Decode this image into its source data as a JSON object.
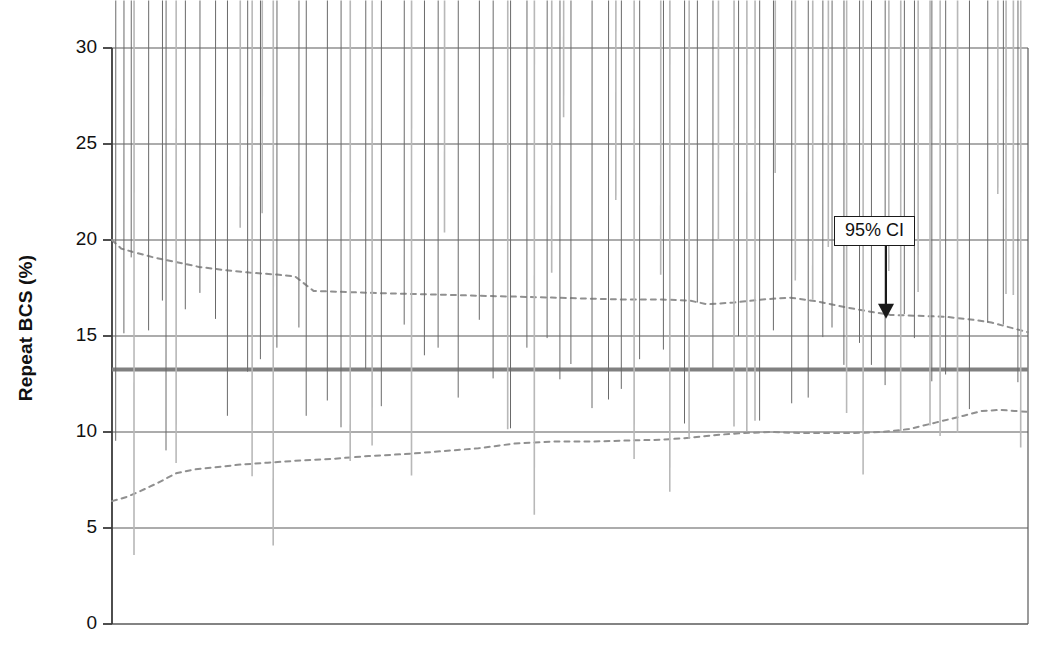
{
  "chart_data": {
    "type": "scatter",
    "title": "",
    "xlabel": "",
    "ylabel": "Repeat BCS (%)",
    "ylim": [
      0,
      30
    ],
    "yticks": [
      0,
      5,
      10,
      15,
      20,
      25,
      30
    ],
    "ytick_labels": [
      "0",
      "5",
      "10",
      "15",
      "20",
      "25",
      "30"
    ],
    "xlim": [
      0,
      100
    ],
    "xticks": [],
    "xtick_labels": [],
    "grid": "horizontal",
    "legend": "none",
    "annotations": [
      {
        "text": "95% CI",
        "x": 84.5,
        "y": 20.4,
        "arrow_to_x": 84.5,
        "arrow_to_y": 16.0,
        "style": "boxed-with-down-arrow"
      }
    ],
    "reference_lines": [
      {
        "name": "mean-line",
        "type": "horizontal-solid",
        "value": 13.25,
        "color": "#808080",
        "width": 4
      }
    ],
    "series": [
      {
        "name": "Repeat BCS - within 95% CI",
        "marker": "filled-diamond",
        "color": "#7a7a7a",
        "points": [
          [
            0.4,
            9.1
          ],
          [
            1.3,
            14.7
          ],
          [
            2.1,
            18.65
          ],
          [
            4.0,
            14.85
          ],
          [
            5.5,
            16.4
          ],
          [
            5.9,
            8.6
          ],
          [
            8.0,
            15.95
          ],
          [
            9.6,
            16.8
          ],
          [
            11.3,
            15.45
          ],
          [
            12.6,
            10.4
          ],
          [
            14.8,
            12.7
          ],
          [
            16.2,
            13.35
          ],
          [
            18.0,
            13.95
          ],
          [
            20.4,
            15.0
          ],
          [
            21.2,
            10.4
          ],
          [
            23.5,
            11.2
          ],
          [
            25.0,
            9.8
          ],
          [
            27.7,
            12.85
          ],
          [
            29.4,
            10.9
          ],
          [
            31.9,
            15.15
          ],
          [
            34.1,
            13.55
          ],
          [
            35.6,
            13.95
          ],
          [
            37.8,
            11.35
          ],
          [
            40.1,
            15.4
          ],
          [
            41.6,
            12.35
          ],
          [
            43.5,
            9.75
          ],
          [
            45.3,
            13.95
          ],
          [
            47.5,
            14.45
          ],
          [
            48.9,
            12.3
          ],
          [
            50.1,
            13.1
          ],
          [
            52.4,
            10.8
          ],
          [
            54.2,
            11.25
          ],
          [
            55.6,
            11.8
          ],
          [
            57.6,
            13.35
          ],
          [
            60.2,
            13.85
          ],
          [
            62.5,
            10.0
          ],
          [
            63.9,
            16.3
          ],
          [
            65.6,
            12.9
          ],
          [
            68.4,
            14.55
          ],
          [
            70.7,
            10.15
          ],
          [
            72.2,
            14.85
          ],
          [
            74.2,
            11.05
          ],
          [
            76.0,
            11.35
          ],
          [
            77.6,
            14.5
          ],
          [
            78.6,
            15.0
          ],
          [
            79.9,
            13.05
          ],
          [
            81.6,
            14.2
          ],
          [
            82.9,
            13.05
          ],
          [
            84.4,
            12.0
          ],
          [
            86.5,
            15.7
          ],
          [
            87.6,
            14.45
          ],
          [
            89.5,
            12.2
          ],
          [
            91.0,
            12.55
          ],
          [
            93.6,
            10.75
          ],
          [
            95.6,
            15.25
          ],
          [
            97.3,
            15.15
          ],
          [
            98.9,
            12.15
          ]
        ]
      },
      {
        "name": "Repeat BCS - outside 95% CI",
        "marker": "open-diamond",
        "color": "#b8b8b8",
        "points": [
          [
            2.4,
            3.2
          ],
          [
            7.0,
            8.0
          ],
          [
            14.0,
            20.25
          ],
          [
            15.3,
            7.3
          ],
          [
            16.4,
            21.0
          ],
          [
            17.6,
            3.7
          ],
          [
            26.0,
            8.1
          ],
          [
            28.4,
            8.9
          ],
          [
            32.7,
            7.35
          ],
          [
            36.3,
            20.0
          ],
          [
            43.2,
            9.75
          ],
          [
            46.1,
            5.3
          ],
          [
            48.0,
            17.9
          ],
          [
            49.3,
            26.0
          ],
          [
            55.0,
            21.7
          ],
          [
            57.0,
            8.2
          ],
          [
            59.9,
            17.8
          ],
          [
            60.9,
            6.5
          ],
          [
            63.0,
            9.25
          ],
          [
            66.2,
            19.6
          ],
          [
            67.9,
            9.9
          ],
          [
            69.3,
            9.65
          ],
          [
            70.2,
            10.2
          ],
          [
            72.4,
            23.1
          ],
          [
            74.6,
            17.5
          ],
          [
            76.5,
            16.5
          ],
          [
            78.2,
            19.25
          ],
          [
            80.2,
            10.6
          ],
          [
            82.0,
            7.4
          ],
          [
            84.8,
            18.0
          ],
          [
            86.1,
            9.55
          ],
          [
            88.0,
            16.9
          ],
          [
            89.3,
            9.95
          ],
          [
            90.4,
            9.4
          ],
          [
            92.3,
            9.55
          ],
          [
            96.7,
            22.0
          ],
          [
            97.6,
            16.8
          ],
          [
            98.4,
            16.75
          ],
          [
            99.2,
            8.8
          ]
        ]
      }
    ],
    "ci_bands": [
      {
        "name": "upper-95-ci",
        "style": "dotted",
        "color": "#909090",
        "points": [
          [
            0.0,
            20.0
          ],
          [
            1.0,
            19.55
          ],
          [
            2.5,
            19.35
          ],
          [
            4.5,
            19.1
          ],
          [
            7.0,
            18.85
          ],
          [
            9.5,
            18.6
          ],
          [
            12.0,
            18.45
          ],
          [
            15.0,
            18.3
          ],
          [
            18.0,
            18.2
          ],
          [
            20.0,
            18.1
          ],
          [
            22.0,
            17.35
          ],
          [
            25.0,
            17.3
          ],
          [
            28.0,
            17.25
          ],
          [
            32.0,
            17.2
          ],
          [
            36.0,
            17.15
          ],
          [
            40.0,
            17.1
          ],
          [
            44.0,
            17.05
          ],
          [
            48.0,
            17.0
          ],
          [
            52.0,
            16.95
          ],
          [
            56.0,
            16.9
          ],
          [
            60.0,
            16.9
          ],
          [
            63.0,
            16.85
          ],
          [
            65.0,
            16.65
          ],
          [
            68.0,
            16.75
          ],
          [
            71.0,
            16.9
          ],
          [
            74.0,
            17.0
          ],
          [
            77.0,
            16.8
          ],
          [
            80.0,
            16.5
          ],
          [
            83.0,
            16.25
          ],
          [
            85.0,
            16.1
          ],
          [
            88.0,
            16.05
          ],
          [
            91.0,
            16.0
          ],
          [
            94.0,
            15.85
          ],
          [
            96.0,
            15.7
          ],
          [
            98.0,
            15.45
          ],
          [
            100.0,
            15.2
          ]
        ]
      },
      {
        "name": "lower-95-ci",
        "style": "dotted",
        "color": "#909090",
        "points": [
          [
            0.0,
            6.4
          ],
          [
            1.5,
            6.6
          ],
          [
            3.0,
            6.9
          ],
          [
            5.0,
            7.35
          ],
          [
            7.0,
            7.85
          ],
          [
            9.0,
            8.05
          ],
          [
            11.0,
            8.15
          ],
          [
            14.0,
            8.3
          ],
          [
            17.0,
            8.4
          ],
          [
            20.0,
            8.5
          ],
          [
            24.0,
            8.6
          ],
          [
            28.0,
            8.75
          ],
          [
            32.0,
            8.85
          ],
          [
            36.0,
            9.0
          ],
          [
            40.0,
            9.15
          ],
          [
            44.0,
            9.4
          ],
          [
            48.0,
            9.5
          ],
          [
            52.0,
            9.5
          ],
          [
            56.0,
            9.55
          ],
          [
            60.0,
            9.6
          ],
          [
            63.0,
            9.7
          ],
          [
            66.0,
            9.85
          ],
          [
            69.0,
            9.95
          ],
          [
            72.0,
            10.0
          ],
          [
            75.0,
            9.95
          ],
          [
            78.0,
            9.95
          ],
          [
            81.0,
            9.95
          ],
          [
            84.0,
            10.0
          ],
          [
            87.0,
            10.15
          ],
          [
            90.0,
            10.5
          ],
          [
            93.0,
            10.85
          ],
          [
            95.0,
            11.1
          ],
          [
            97.0,
            11.15
          ],
          [
            98.5,
            11.1
          ],
          [
            100.0,
            11.05
          ]
        ]
      }
    ]
  },
  "axis": {
    "y_title": "Repeat BCS (%)"
  },
  "annotation_box": {
    "label": "95% CI"
  }
}
